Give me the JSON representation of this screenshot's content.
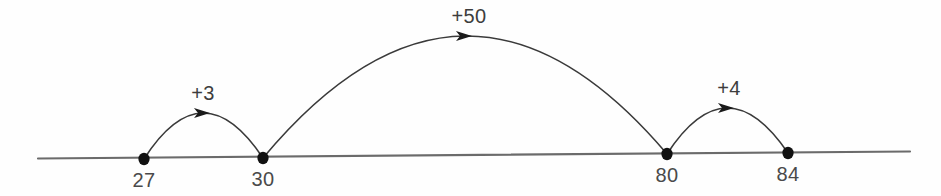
{
  "chart_data": {
    "type": "line",
    "title": "",
    "subtitle": "",
    "xlabel": "",
    "ylabel": "",
    "grid": false,
    "legend": null,
    "axis_start_value": 27,
    "axis_end_value": 84,
    "tick_labels": [
      "27",
      "30",
      "80",
      "84"
    ],
    "tick_values": [
      27,
      30,
      80,
      84
    ],
    "points": [
      {
        "label": "27",
        "value": 27,
        "x": 144,
        "y": 159
      },
      {
        "label": "30",
        "value": 30,
        "x": 263,
        "y": 158
      },
      {
        "label": "80",
        "value": 80,
        "x": 667,
        "y": 154
      },
      {
        "label": "84",
        "value": 84,
        "x": 788,
        "y": 153
      }
    ],
    "jumps": [
      {
        "label": "+3",
        "amount": 3,
        "from_value": 27,
        "to_value": 30,
        "from_x": 144,
        "from_y": 159,
        "to_x": 263,
        "to_y": 158,
        "apex_x": 203,
        "apex_y": 113,
        "label_x": 203,
        "label_y": 100,
        "direction": "right"
      },
      {
        "label": "+50",
        "amount": 50,
        "from_value": 30,
        "to_value": 80,
        "from_x": 263,
        "from_y": 158,
        "to_x": 667,
        "to_y": 154,
        "apex_x": 465,
        "apex_y": 36,
        "label_x": 469,
        "label_y": 23,
        "direction": "right"
      },
      {
        "label": "+4",
        "amount": 4,
        "from_value": 80,
        "to_value": 84,
        "from_x": 667,
        "from_y": 154,
        "to_x": 788,
        "to_y": 153,
        "apex_x": 727,
        "apex_y": 108,
        "label_x": 729,
        "label_y": 95,
        "direction": "right"
      }
    ],
    "number_line": {
      "x1": 38,
      "y1": 158.5,
      "x2": 910,
      "y2": 151.5,
      "color": "#6b6b6b"
    }
  },
  "colors": {
    "background": "#fefefe",
    "line": "#6b6b6b",
    "arc": "#3a3a3a",
    "dot": "#111111",
    "tick_text": "#4a4a4a",
    "jump_text": "#3d3d3d"
  }
}
